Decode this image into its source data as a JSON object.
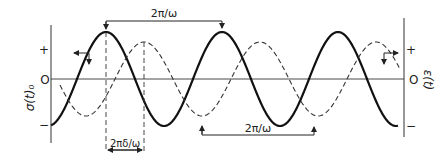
{
  "diagram": {
    "left_axis": {
      "label": "σ(t)₀",
      "ticks": {
        "plus": "+",
        "zero": "O",
        "minus": "−"
      }
    },
    "right_axis": {
      "label": "ε(t)",
      "ticks": {
        "plus": "+",
        "zero": "O",
        "minus": "−"
      }
    },
    "curves": [
      {
        "name": "stress",
        "style": "solid",
        "description": "σ(t)"
      },
      {
        "name": "strain",
        "style": "dashed",
        "description": "ε(t)"
      }
    ],
    "annotations": {
      "top_period": "2π/ω",
      "bottom_period": "2π/ω",
      "phase_lag": "2πδ/ω"
    },
    "colors": {
      "ink": "#222222",
      "background": "#ffffff"
    }
  }
}
